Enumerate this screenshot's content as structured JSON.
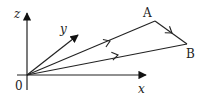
{
  "diagram": {
    "type": "3d-coordinate-path",
    "axes": {
      "x_label": "x",
      "y_label": "y",
      "z_label": "z",
      "origin_label": "0"
    },
    "points": [
      {
        "id": "A",
        "label": "A"
      },
      {
        "id": "B",
        "label": "B"
      }
    ],
    "path_segments": [
      {
        "from": "0",
        "to": "A",
        "direction": "outward"
      },
      {
        "from": "A",
        "to": "B",
        "direction": "A-to-B"
      },
      {
        "from": "B",
        "to": "0",
        "direction": "outward-from-origin"
      }
    ],
    "line_color": "#222222"
  }
}
